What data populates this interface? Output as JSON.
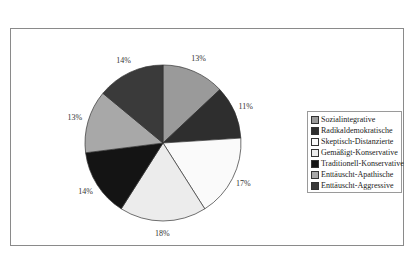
{
  "chart_data": {
    "type": "pie",
    "title": "",
    "categories": [
      "Sozialintegrative",
      "Radikaldemokratische",
      "Skeptisch-Distanzierte",
      "Gemäßigt-Konservative",
      "Traditionell-Konservative",
      "Enttäuscht-Apathische",
      "Enttäuscht-Aggressive"
    ],
    "values": [
      13,
      11,
      17,
      18,
      14,
      13,
      14
    ],
    "labels": [
      "13%",
      "11%",
      "17%",
      "18%",
      "14%",
      "13%",
      "14%"
    ],
    "colors": [
      "#9a9a9a",
      "#2e2e2e",
      "#fafafa",
      "#ececec",
      "#141414",
      "#a8a8a8",
      "#3a3a3a"
    ],
    "legend_position": "right",
    "start_angle_deg": 0,
    "direction": "clockwise"
  },
  "legend": {
    "items": [
      {
        "label": "Sozialintegrative",
        "color": "#9a9a9a"
      },
      {
        "label": "Radikaldemokratische",
        "color": "#2e2e2e"
      },
      {
        "label": "Skeptisch-Distanzierte",
        "color": "#fafafa"
      },
      {
        "label": "Gemäßigt-Konservative",
        "color": "#ececec"
      },
      {
        "label": "Traditionell-Konservative",
        "color": "#141414"
      },
      {
        "label": "Enttäuscht-Apathische",
        "color": "#a8a8a8"
      },
      {
        "label": "Enttäuscht-Aggressive",
        "color": "#3a3a3a"
      }
    ]
  }
}
